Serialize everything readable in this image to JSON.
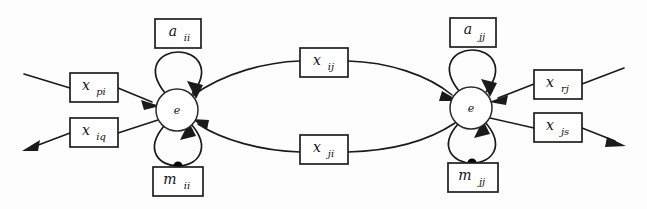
{
  "figure": {
    "background_color": "#fdfdfd",
    "line_color": "#1a1a1a",
    "width": 647,
    "height": 209
  },
  "nodes": [
    {
      "id": "node-i",
      "label": "e",
      "cx": 177,
      "cy": 110,
      "r": 21
    },
    {
      "id": "node-j",
      "label": "e",
      "cx": 471,
      "cy": 108,
      "r": 21
    }
  ],
  "boxes": [
    {
      "id": "box-a-ii",
      "base": "a",
      "sub": "ii",
      "x": 155,
      "y": 19,
      "w": 46,
      "h": 29
    },
    {
      "id": "box-m-ii",
      "base": "m",
      "sub": "ii",
      "x": 153,
      "y": 167,
      "w": 50,
      "h": 29
    },
    {
      "id": "box-a-jj",
      "base": "a",
      "sub": "jj",
      "x": 450,
      "y": 18,
      "w": 46,
      "h": 29
    },
    {
      "id": "box-m-jj",
      "base": "m",
      "sub": "jj",
      "x": 448,
      "y": 163,
      "w": 50,
      "h": 29
    },
    {
      "id": "box-x-pi",
      "base": "x",
      "sub": "pi",
      "x": 70,
      "y": 73,
      "w": 48,
      "h": 29
    },
    {
      "id": "box-x-iq",
      "base": "x",
      "sub": "iq",
      "x": 70,
      "y": 118,
      "w": 48,
      "h": 29
    },
    {
      "id": "box-x-ij",
      "base": "x",
      "sub": "ij",
      "x": 300,
      "y": 48,
      "w": 48,
      "h": 29
    },
    {
      "id": "box-x-ji",
      "base": "x",
      "sub": "ji",
      "x": 300,
      "y": 135,
      "w": 48,
      "h": 29
    },
    {
      "id": "box-x-rj",
      "base": "x",
      "sub": "rj",
      "x": 534,
      "y": 70,
      "w": 48,
      "h": 29
    },
    {
      "id": "box-x-js",
      "base": "x",
      "sub": "js",
      "x": 534,
      "y": 113,
      "w": 48,
      "h": 29
    }
  ],
  "labels": {
    "node_i": "e",
    "node_j": "e",
    "a_ii": "a",
    "a_ii_sub": "ii",
    "m_ii": "m",
    "m_ii_sub": "ii",
    "a_jj": "a",
    "a_jj_sub": "jj",
    "m_jj": "m",
    "m_jj_sub": "jj",
    "x_pi": "x",
    "x_pi_sub": "pi",
    "x_iq": "x",
    "x_iq_sub": "iq",
    "x_ij": "x",
    "x_ij_sub": "ij",
    "x_ji": "x",
    "x_ji_sub": "ji",
    "x_rj": "x",
    "x_rj_sub": "rj",
    "x_js": "x",
    "x_js_sub": "js"
  },
  "edges": [
    {
      "id": "edge-external-in-left",
      "from": "external",
      "to": "box-x-pi",
      "direction": "into-box"
    },
    {
      "id": "edge-x-pi-to-node-i",
      "from": "box-x-pi",
      "to": "node-i",
      "direction": "arrow"
    },
    {
      "id": "edge-node-i-to-x-iq",
      "from": "node-i",
      "to": "box-x-iq",
      "direction": "line"
    },
    {
      "id": "edge-x-iq-external-out",
      "from": "box-x-iq",
      "to": "external",
      "direction": "arrow"
    },
    {
      "id": "edge-node-i-to-x-ij",
      "from": "node-i",
      "to": "box-x-ij",
      "direction": "line"
    },
    {
      "id": "edge-x-ij-to-node-j",
      "from": "box-x-ij",
      "to": "node-j",
      "direction": "arrow"
    },
    {
      "id": "edge-node-j-to-x-ji",
      "from": "node-j",
      "to": "box-x-ji",
      "direction": "line"
    },
    {
      "id": "edge-x-ji-to-node-i",
      "from": "box-x-ji",
      "to": "node-i",
      "direction": "arrow"
    },
    {
      "id": "edge-external-in-right",
      "from": "external",
      "to": "box-x-rj",
      "direction": "into-box"
    },
    {
      "id": "edge-x-rj-to-node-j",
      "from": "box-x-rj",
      "to": "node-j",
      "direction": "arrow"
    },
    {
      "id": "edge-node-j-to-x-js",
      "from": "node-j",
      "to": "box-x-js",
      "direction": "line"
    },
    {
      "id": "edge-x-js-external-out",
      "from": "box-x-js",
      "to": "external",
      "direction": "arrow"
    },
    {
      "id": "selfloop-a-ii",
      "from": "node-i",
      "to": "node-i",
      "via": "box-a-ii",
      "direction": "arrow"
    },
    {
      "id": "selfloop-m-ii",
      "from": "node-i",
      "to": "node-i",
      "via": "box-m-ii",
      "direction": "arrow-with-dot"
    },
    {
      "id": "selfloop-a-jj",
      "from": "node-j",
      "to": "node-j",
      "via": "box-a-jj",
      "direction": "arrow"
    },
    {
      "id": "selfloop-m-jj",
      "from": "node-j",
      "to": "node-j",
      "via": "box-m-jj",
      "direction": "arrow-with-dot"
    }
  ]
}
